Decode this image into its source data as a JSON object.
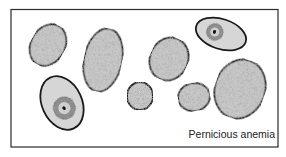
{
  "figure": {
    "caption": "Pernicious anemia",
    "colors": {
      "frame": "#2a2a2a",
      "cell_fill": "#c9c9c9",
      "cell_stroke": "#1a1a1a",
      "nucleated_fill": "#d6d6d6",
      "background": "#ffffff"
    },
    "cells": [
      {
        "id": "cell-1",
        "type": "macrocyte",
        "cx": 48,
        "cy": 45,
        "rx": 17,
        "ry": 22,
        "rot": 30
      },
      {
        "id": "cell-2",
        "type": "macrocyte",
        "cx": 103,
        "cy": 60,
        "rx": 19,
        "ry": 32,
        "rot": 12
      },
      {
        "id": "cell-3",
        "type": "megaloblast",
        "cx": 62,
        "cy": 103,
        "rx": 20,
        "ry": 28,
        "rot": -25
      },
      {
        "id": "cell-4",
        "type": "normocyte",
        "cx": 140,
        "cy": 96,
        "rx": 13,
        "ry": 14,
        "rot": 0
      },
      {
        "id": "cell-5",
        "type": "macrocyte",
        "cx": 169,
        "cy": 59,
        "rx": 19,
        "ry": 22,
        "rot": 25
      },
      {
        "id": "cell-6",
        "type": "normocyte",
        "cx": 194,
        "cy": 97,
        "rx": 16,
        "ry": 14,
        "rot": -10
      },
      {
        "id": "cell-7",
        "type": "megaloblast",
        "cx": 221,
        "cy": 34,
        "rx": 26,
        "ry": 15,
        "rot": 18
      },
      {
        "id": "cell-8",
        "type": "macrocyte",
        "cx": 240,
        "cy": 89,
        "rx": 25,
        "ry": 30,
        "rot": 20
      }
    ]
  }
}
